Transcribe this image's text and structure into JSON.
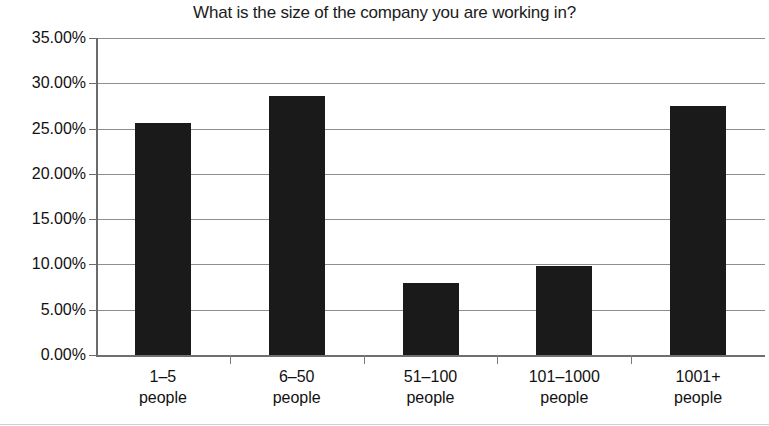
{
  "chart_data": {
    "type": "bar",
    "title": "What is the size of the company you are working in?",
    "xlabel": "",
    "ylabel": "",
    "categories": [
      "1–5 people",
      "6–50 people",
      "51–100 people",
      "101–1000 people",
      "1001+ people"
    ],
    "category_parts": [
      {
        "range": "1–5",
        "unit": "people"
      },
      {
        "range": "6–50",
        "unit": "people"
      },
      {
        "range": "51–100",
        "unit": "people"
      },
      {
        "range": "101–1000",
        "unit": "people"
      },
      {
        "range": "1001+",
        "unit": "people"
      }
    ],
    "values": [
      25.6,
      28.6,
      7.9,
      9.8,
      27.5
    ],
    "value_labels": [
      "25.60%",
      "28.60%",
      "7.90%",
      "9.80%",
      "27.50%"
    ],
    "ylim": [
      0,
      35
    ],
    "ytick_values": [
      0,
      5,
      10,
      15,
      20,
      25,
      30,
      35
    ],
    "ytick_labels": [
      "0.00%",
      "5.00%",
      "10.00%",
      "15.00%",
      "20.00%",
      "25.00%",
      "30.00%",
      "35.00%"
    ],
    "grid": true,
    "grid_axis": "y",
    "legend": null,
    "legend_position": "none",
    "series_color": "#1a1a1a",
    "gridline_color": "#8e8e8e",
    "axis_color": "#6b6b6b",
    "text_color": "#111111",
    "background": "#ffffff"
  }
}
